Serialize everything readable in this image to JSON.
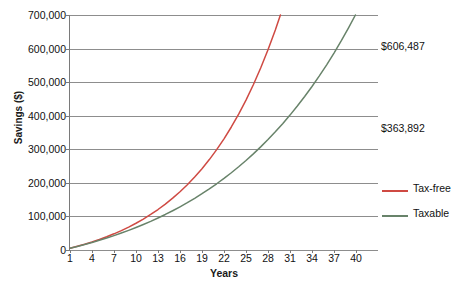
{
  "chart_data": {
    "type": "line",
    "title": "",
    "xlabel": "Years",
    "ylabel": "Savings ($)",
    "xlim": [
      1,
      43
    ],
    "ylim": [
      0,
      700000
    ],
    "grid": true,
    "legend_position": "right",
    "x_ticks": [
      "1",
      "4",
      "7",
      "10",
      "13",
      "16",
      "19",
      "22",
      "25",
      "28",
      "31",
      "34",
      "37",
      "40"
    ],
    "x_tick_values": [
      1,
      4,
      7,
      10,
      13,
      16,
      19,
      22,
      25,
      28,
      31,
      34,
      37,
      40
    ],
    "y_ticks": [
      "0",
      "100,000",
      "200,000",
      "300,000",
      "400,000",
      "500,000",
      "600,000",
      "700,000"
    ],
    "y_tick_values": [
      0,
      100000,
      200000,
      300000,
      400000,
      500000,
      600000,
      700000
    ],
    "x": [
      1,
      2,
      3,
      4,
      5,
      6,
      7,
      8,
      9,
      10,
      11,
      12,
      13,
      14,
      15,
      16,
      17,
      18,
      19,
      20,
      21,
      22,
      23,
      24,
      25,
      26,
      27,
      28,
      29,
      30,
      31,
      32,
      33,
      34,
      35,
      36,
      37,
      38,
      39,
      40,
      41,
      42,
      43
    ],
    "series": [
      {
        "name": "Tax-free",
        "color": "#cf4a43",
        "end_label": "$606,487",
        "values": [
          5200,
          10900,
          17100,
          23900,
          31300,
          39400,
          48200,
          57800,
          68300,
          79700,
          92200,
          105800,
          120600,
          136800,
          154400,
          173600,
          194500,
          217300,
          242200,
          269300,
          298900,
          331200,
          366400,
          404700,
          446600,
          492200,
          542000,
          596300,
          655400,
          719900,
          790100,
          866700,
          950200,
          1041000,
          1140000,
          1247000,
          1365000,
          1492000,
          1631000,
          1783000,
          1948000,
          2127000,
          2323000
        ]
      },
      {
        "name": "Taxable",
        "color": "#68836a",
        "end_label": "$363,892",
        "values": [
          5100,
          10500,
          16200,
          22300,
          28800,
          35600,
          42800,
          50500,
          58500,
          67000,
          76000,
          85400,
          95400,
          105900,
          117000,
          128700,
          141000,
          154000,
          167700,
          182100,
          197300,
          213300,
          230200,
          248000,
          266700,
          286400,
          307200,
          329000,
          352000,
          376300,
          401800,
          428700,
          457100,
          487000,
          518500,
          551700,
          586700,
          623600,
          662500,
          703400,
          746600,
          792100,
          840000
        ]
      }
    ],
    "annotations": [
      {
        "text": "$606,487",
        "series": "Tax-free",
        "value": 606487,
        "year": 41
      },
      {
        "text": "$363,892",
        "series": "Taxable",
        "value": 363892,
        "year": 41
      }
    ]
  }
}
